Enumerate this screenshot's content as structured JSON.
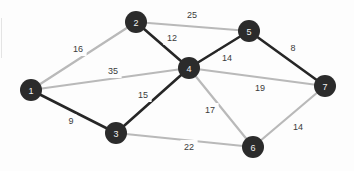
{
  "figure": {
    "kind": "weighted-undirected-graph",
    "background_color": "#fdfdfd",
    "node_fill_color": "#2b2b2b",
    "node_label_color": "#f2f2f2",
    "node_radius": 11,
    "edge_dark_color": "#262626",
    "edge_light_color": "#b9b9b9",
    "edge_dark_width": 2.6,
    "edge_light_width": 2.2,
    "weight_text_color": "#3b3b3b"
  },
  "chart_data": {
    "type": "diagram",
    "title": "",
    "nodes": [
      {
        "id": "1",
        "label": "1",
        "x": 31,
        "y": 90
      },
      {
        "id": "2",
        "label": "2",
        "x": 136,
        "y": 22
      },
      {
        "id": "3",
        "label": "3",
        "x": 116,
        "y": 133
      },
      {
        "id": "4",
        "label": "4",
        "x": 189,
        "y": 68
      },
      {
        "id": "5",
        "label": "5",
        "x": 249,
        "y": 31
      },
      {
        "id": "6",
        "label": "6",
        "x": 253,
        "y": 147
      },
      {
        "id": "7",
        "label": "7",
        "x": 325,
        "y": 86
      }
    ],
    "edges": [
      {
        "id": "e-1-2",
        "source": "1",
        "target": "2",
        "weight": 16,
        "weight_label": "16",
        "style": "light",
        "label_x": 78,
        "label_y": 49
      },
      {
        "id": "e-1-4",
        "source": "1",
        "target": "4",
        "weight": 35,
        "weight_label": "35",
        "style": "light",
        "label_x": 113,
        "label_y": 71
      },
      {
        "id": "e-1-3",
        "source": "1",
        "target": "3",
        "weight": 9,
        "weight_label": "9",
        "style": "dark",
        "label_x": 71,
        "label_y": 121
      },
      {
        "id": "e-2-5",
        "source": "2",
        "target": "5",
        "weight": 25,
        "weight_label": "25",
        "style": "light",
        "label_x": 192,
        "label_y": 15
      },
      {
        "id": "e-2-4",
        "source": "2",
        "target": "4",
        "weight": 12,
        "weight_label": "12",
        "style": "dark",
        "label_x": 172,
        "label_y": 38
      },
      {
        "id": "e-3-4",
        "source": "3",
        "target": "4",
        "weight": 15,
        "weight_label": "15",
        "style": "dark",
        "label_x": 143,
        "label_y": 95
      },
      {
        "id": "e-3-6",
        "source": "3",
        "target": "6",
        "weight": 22,
        "weight_label": "22",
        "style": "light",
        "label_x": 189,
        "label_y": 147
      },
      {
        "id": "e-4-5",
        "source": "4",
        "target": "5",
        "weight": 14,
        "weight_label": "14",
        "style": "dark",
        "label_x": 227,
        "label_y": 58
      },
      {
        "id": "e-4-7",
        "source": "4",
        "target": "7",
        "weight": 19,
        "weight_label": "19",
        "style": "light",
        "label_x": 260,
        "label_y": 88
      },
      {
        "id": "e-4-6",
        "source": "4",
        "target": "6",
        "weight": 17,
        "weight_label": "17",
        "style": "light",
        "label_x": 210,
        "label_y": 110
      },
      {
        "id": "e-5-7",
        "source": "5",
        "target": "7",
        "weight": 8,
        "weight_label": "8",
        "style": "dark",
        "label_x": 293,
        "label_y": 48
      },
      {
        "id": "e-6-7",
        "source": "6",
        "target": "7",
        "weight": 14,
        "weight_label": "14",
        "style": "light",
        "label_x": 298,
        "label_y": 127
      }
    ]
  }
}
